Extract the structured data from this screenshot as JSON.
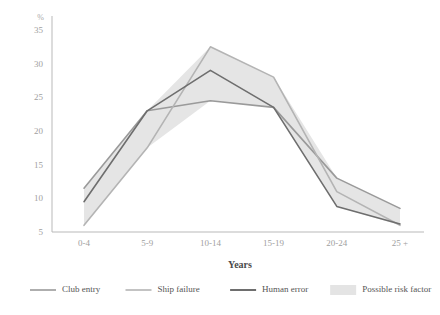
{
  "chart_data": {
    "type": "line",
    "title": "",
    "xlabel": "Years",
    "ylabel": "%",
    "categories": [
      "0-4",
      "5-9",
      "10-14",
      "15-19",
      "20-24",
      "25 +"
    ],
    "ylim": [
      5,
      35
    ],
    "yticks": [
      5,
      10,
      15,
      20,
      25,
      30,
      35
    ],
    "grid": false,
    "legend_position": "bottom",
    "series": [
      {
        "name": "Club entry",
        "color": "#9a9a9a",
        "values": [
          11.5,
          23.0,
          24.5,
          23.5,
          13.0,
          8.5
        ]
      },
      {
        "name": "Ship failure",
        "color": "#b4b4b4",
        "values": [
          6.0,
          17.5,
          32.5,
          28.0,
          11.0,
          6.0
        ]
      },
      {
        "name": "Human error",
        "color": "#6e6e6e",
        "values": [
          9.5,
          23.0,
          29.0,
          23.5,
          8.8,
          6.2
        ]
      }
    ],
    "band": {
      "name": "Possible risk factor",
      "color": "#e4e4e4",
      "upper": [
        11.5,
        23.0,
        32.5,
        28.0,
        13.0,
        8.5
      ],
      "lower": [
        6.0,
        17.5,
        24.5,
        23.5,
        8.8,
        6.0
      ]
    }
  },
  "legend": {
    "items": [
      {
        "label": "Club entry",
        "marker": "line",
        "color": "#9a9a9a"
      },
      {
        "label": "Ship failure",
        "marker": "line",
        "color": "#b4b4b4"
      },
      {
        "label": "Human error",
        "marker": "line",
        "color": "#6e6e6e"
      },
      {
        "label": "Possible risk factor",
        "marker": "swatch",
        "color": "#e4e4e4"
      }
    ]
  },
  "axes": {
    "y_unit_label": "%",
    "x_axis_title": "Years"
  }
}
